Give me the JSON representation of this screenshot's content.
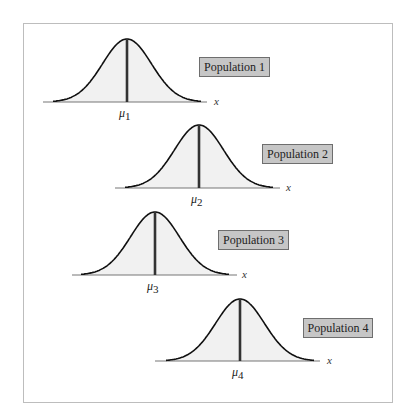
{
  "figure": {
    "colors": {
      "curve": "#111111",
      "fill": "#f1f1f1",
      "mean_line": "#333333",
      "axis": "#777777",
      "label_bg": "#c6c6c6",
      "label_border": "#6e6e6e",
      "frame": "#bdbdbd"
    },
    "axis_label": "x",
    "populations": [
      {
        "label": "Population 1",
        "mean_symbol": "μ",
        "mean_sub": "1",
        "peak_x": 127,
        "baseline_y": 102,
        "peak_y": 39,
        "axis_start": 43,
        "axis_end": 207,
        "label_box": {
          "x": 199,
          "y": 57,
          "w": 71
        },
        "x_label_pos": {
          "x": 214,
          "y": 95
        }
      },
      {
        "label": "Population 2",
        "mean_symbol": "μ",
        "mean_sub": "2",
        "peak_x": 199,
        "baseline_y": 188,
        "peak_y": 125,
        "axis_start": 115,
        "axis_end": 280,
        "label_box": {
          "x": 262,
          "y": 144,
          "w": 71
        },
        "x_label_pos": {
          "x": 286,
          "y": 181
        }
      },
      {
        "label": "Population 3",
        "mean_symbol": "μ",
        "mean_sub": "3",
        "peak_x": 155,
        "baseline_y": 275,
        "peak_y": 212,
        "axis_start": 72,
        "axis_end": 237,
        "label_box": {
          "x": 218,
          "y": 230,
          "w": 71
        },
        "x_label_pos": {
          "x": 242,
          "y": 268
        }
      },
      {
        "label": "Population 4",
        "mean_symbol": "μ",
        "mean_sub": "4",
        "peak_x": 240,
        "baseline_y": 361,
        "peak_y": 299,
        "axis_start": 155,
        "axis_end": 320,
        "label_box": {
          "x": 303,
          "y": 318,
          "w": 70
        },
        "x_label_pos": {
          "x": 327,
          "y": 354
        }
      }
    ]
  }
}
